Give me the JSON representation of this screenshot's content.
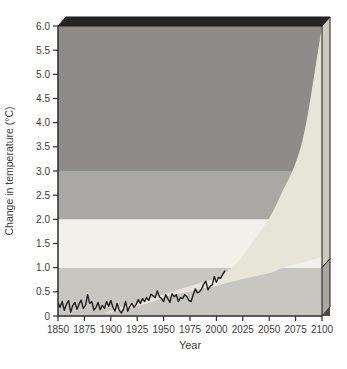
{
  "chart_data": {
    "type": "line",
    "title": "",
    "xlabel": "Year",
    "ylabel": "Change in temperature (°C)",
    "xlim": [
      1850,
      2100
    ],
    "ylim": [
      0,
      6
    ],
    "grid": false,
    "legend": false,
    "x_ticks": [
      1850,
      1875,
      1900,
      1925,
      1950,
      1975,
      2000,
      2025,
      2050,
      2075,
      2100
    ],
    "y_ticks": [
      0,
      0.5,
      1,
      1.5,
      2,
      2.5,
      3,
      3.5,
      4,
      4.5,
      5,
      5.5,
      6
    ],
    "y_tick_labels": [
      "0",
      "0.5",
      "1.0",
      "1.5",
      "2.0",
      "2.5",
      "3.0",
      "3.5",
      "4.0",
      "4.5",
      "5.0",
      "5.5",
      "6.0"
    ],
    "bands": [
      {
        "name": "band-0-1",
        "from": 0,
        "to": 1,
        "color": "#c7c6c1"
      },
      {
        "name": "band-1-2",
        "from": 1,
        "to": 2,
        "color": "#f2f0ea"
      },
      {
        "name": "band-2-3",
        "from": 2,
        "to": 3,
        "color": "#aaa8a5"
      },
      {
        "name": "band-3-6",
        "from": 3,
        "to": 6,
        "color": "#8e8b88"
      }
    ],
    "projection_fan": {
      "name": "projected-temperature-range",
      "color": "#e7e4d8",
      "x": [
        1895,
        1910,
        1925,
        1940,
        1950,
        1960,
        1975,
        1990,
        2000,
        2010,
        2022,
        2036,
        2052,
        2063,
        2072,
        2080,
        2086,
        2092,
        2096,
        2100
      ],
      "upper": [
        0.07,
        0.18,
        0.28,
        0.38,
        0.45,
        0.52,
        0.62,
        0.72,
        0.78,
        0.92,
        1.16,
        1.57,
        2.1,
        2.6,
        3.0,
        3.5,
        4.1,
        4.9,
        5.45,
        6.0
      ],
      "lower": [
        0.05,
        0.12,
        0.2,
        0.3,
        0.38,
        0.44,
        0.5,
        0.58,
        0.62,
        0.68,
        0.75,
        0.82,
        0.9,
        1.0,
        1.05,
        1.1,
        1.14,
        1.18,
        1.2,
        1.22
      ]
    },
    "observed_series": {
      "name": "observed-temperature-change",
      "color": "#1f1f1f",
      "x": [
        1850,
        1852,
        1854,
        1856,
        1858,
        1860,
        1862,
        1864,
        1866,
        1868,
        1870,
        1872,
        1874,
        1876,
        1878,
        1880,
        1882,
        1884,
        1886,
        1888,
        1890,
        1892,
        1894,
        1896,
        1898,
        1900,
        1902,
        1904,
        1906,
        1908,
        1910,
        1912,
        1914,
        1916,
        1918,
        1920,
        1922,
        1924,
        1926,
        1928,
        1930,
        1932,
        1934,
        1936,
        1938,
        1940,
        1942,
        1944,
        1946,
        1948,
        1950,
        1952,
        1954,
        1956,
        1958,
        1960,
        1962,
        1964,
        1966,
        1968,
        1970,
        1972,
        1974,
        1976,
        1978,
        1980,
        1982,
        1984,
        1986,
        1988,
        1990,
        1992,
        1994,
        1996,
        1998,
        2000,
        2002,
        2004,
        2006,
        2008
      ],
      "y": [
        0.27,
        0.18,
        0.3,
        0.12,
        0.24,
        0.32,
        0.08,
        0.22,
        0.28,
        0.14,
        0.25,
        0.33,
        0.16,
        0.22,
        0.44,
        0.26,
        0.3,
        0.12,
        0.18,
        0.28,
        0.13,
        0.22,
        0.16,
        0.3,
        0.2,
        0.32,
        0.18,
        0.1,
        0.26,
        0.12,
        0.06,
        0.14,
        0.3,
        0.1,
        0.2,
        0.26,
        0.18,
        0.24,
        0.34,
        0.26,
        0.36,
        0.3,
        0.38,
        0.32,
        0.45,
        0.42,
        0.38,
        0.52,
        0.4,
        0.36,
        0.3,
        0.44,
        0.36,
        0.28,
        0.46,
        0.4,
        0.44,
        0.3,
        0.38,
        0.36,
        0.44,
        0.4,
        0.32,
        0.3,
        0.44,
        0.56,
        0.48,
        0.5,
        0.56,
        0.66,
        0.72,
        0.54,
        0.62,
        0.64,
        0.82,
        0.7,
        0.8,
        0.78,
        0.86,
        0.93
      ]
    }
  },
  "frame": {
    "top_face_color": "#272523",
    "side_face_upper_color": "#cdcabd",
    "side_face_lower_color": "#a7a6a1",
    "side_face_corner_color": "#4c4a47",
    "outline_color": "#1c1b1a",
    "axis_color": "#2e2d2c",
    "text_color": "#3d3c3b",
    "background_color": "#ffffff"
  }
}
